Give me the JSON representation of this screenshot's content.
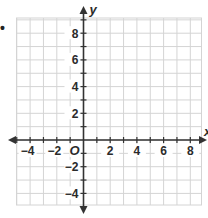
{
  "graph": {
    "type": "coordinate-plane",
    "x_axis": {
      "name": "x",
      "min": -5,
      "max": 9,
      "tick_labels": [
        "-4",
        "-2",
        "2",
        "4",
        "6",
        "8"
      ],
      "tick_values": [
        -4,
        -2,
        2,
        4,
        6,
        8
      ]
    },
    "y_axis": {
      "name": "y",
      "min": -5,
      "max": 9,
      "tick_labels": [
        "8",
        "6",
        "4",
        "2",
        "-2",
        "-4"
      ],
      "tick_values": [
        8,
        6,
        4,
        2,
        -2,
        -4
      ]
    },
    "origin_label": "O",
    "bullet": "•",
    "colors": {
      "grid": "#d4d4d4",
      "axis": "#333333",
      "text": "#2b2b2b"
    }
  }
}
